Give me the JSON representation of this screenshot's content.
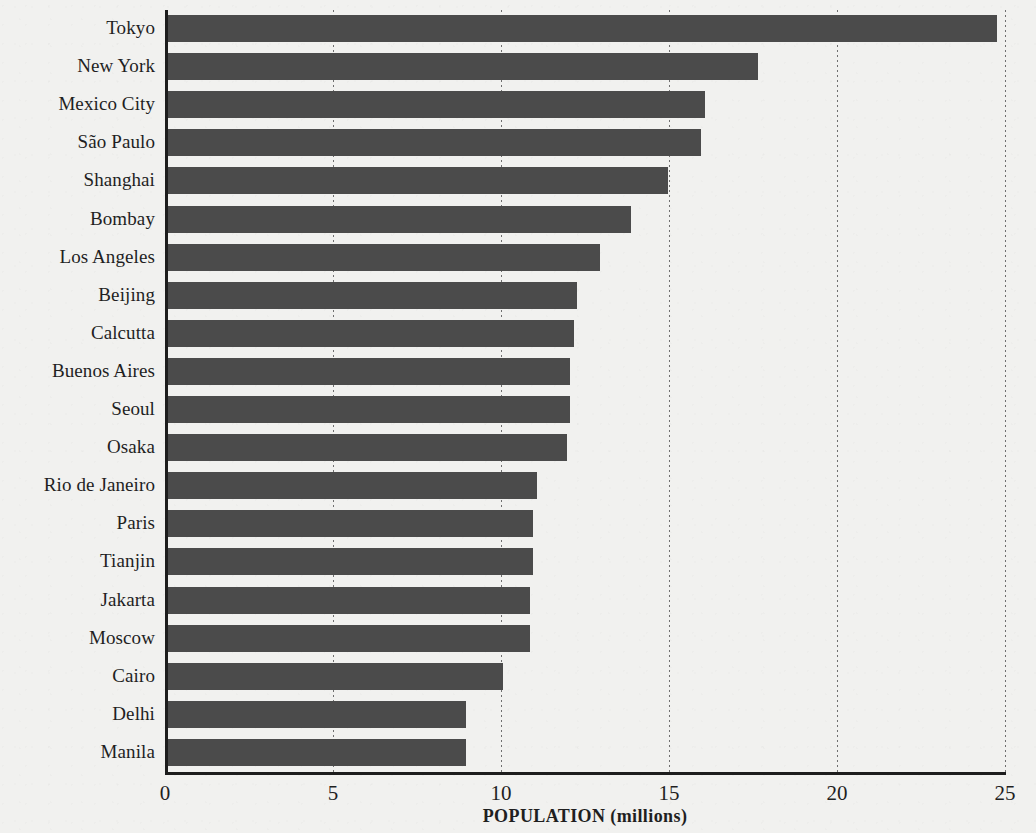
{
  "chart_data": {
    "type": "bar",
    "orientation": "horizontal",
    "title": "",
    "xlabel": "POPULATION (millions)",
    "ylabel": "",
    "xlim": [
      0,
      25
    ],
    "xticks": [
      0,
      5,
      10,
      15,
      20,
      25
    ],
    "xtick_labels": [
      "0",
      "5",
      "10",
      "15",
      "20",
      "25"
    ],
    "grid": "vertical-dotted",
    "legend": "none",
    "bar_color": "#4b4b4b",
    "background_color": "#f1f1ef",
    "categories": [
      "Tokyo",
      "New York",
      "Mexico City",
      "São Paulo",
      "Shanghai",
      "Bombay",
      "Los Angeles",
      "Beijing",
      "Calcutta",
      "Buenos Aires",
      "Seoul",
      "Osaka",
      "Rio de Janeiro",
      "Paris",
      "Tianjin",
      "Jakarta",
      "Moscow",
      "Cairo",
      "Delhi",
      "Manila"
    ],
    "values": [
      24.7,
      17.6,
      16.0,
      15.9,
      14.9,
      13.8,
      12.9,
      12.2,
      12.1,
      12.0,
      12.0,
      11.9,
      11.0,
      10.9,
      10.9,
      10.8,
      10.8,
      10.0,
      8.9,
      8.9
    ]
  }
}
